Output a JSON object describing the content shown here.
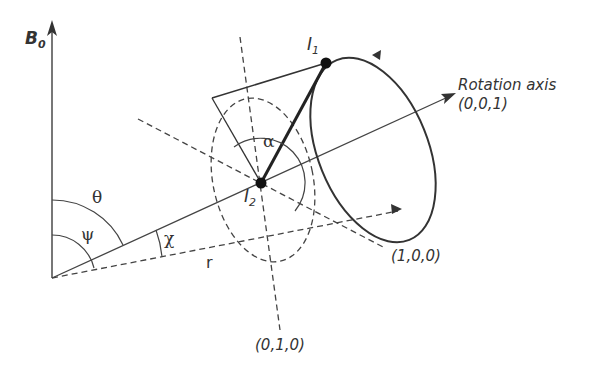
{
  "diagram": {
    "labels": {
      "b0": "B",
      "b0_sub": "0",
      "i1": "I",
      "i1_sub": "1",
      "i2": "I",
      "i2_sub": "2",
      "rotation_axis_line1": "Rotation axis",
      "rotation_axis_line2": "(0,0,1)",
      "axis_x": "(1,0,0)",
      "axis_y": "(0,1,0)",
      "theta": "θ",
      "psi": "ψ",
      "chi": "χ",
      "alpha": "α",
      "r": "r"
    },
    "colors": {
      "line": "#333333",
      "background": "#ffffff"
    }
  }
}
